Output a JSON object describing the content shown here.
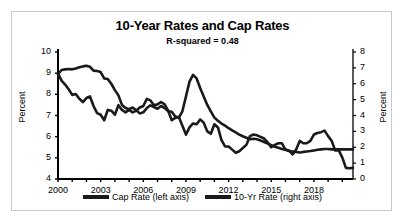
{
  "chart_data": {
    "type": "line",
    "title": "10-Year Rates and Cap Rates",
    "subtitle": "R-squared = 0.48",
    "xlabel": "",
    "ylabel": "Percent",
    "ylabel_right": "Percent",
    "xlim": [
      2000,
      2020.75
    ],
    "ylim": [
      4,
      10
    ],
    "ylim_right": [
      0,
      8
    ],
    "grid": false,
    "legend_position": "bottom",
    "x_ticks": [
      "2000",
      "2003",
      "2006",
      "2009",
      "2012",
      "2015",
      "2018"
    ],
    "x_tick_values": [
      2000,
      2003,
      2006,
      2009,
      2012,
      2015,
      2018
    ],
    "y_ticks_left": [
      "4",
      "5",
      "6",
      "7",
      "8",
      "9",
      "10"
    ],
    "y_tick_values_left": [
      4,
      5,
      6,
      7,
      8,
      9,
      10
    ],
    "y_ticks_right": [
      "0",
      "1",
      "2",
      "3",
      "4",
      "5",
      "6",
      "7",
      "8"
    ],
    "y_tick_values_right": [
      0,
      1,
      2,
      3,
      4,
      5,
      6,
      7,
      8
    ],
    "series": [
      {
        "name": "Cap Rate (left axis)",
        "axis": "left",
        "color": "#1a1a1a",
        "x": [
          2000.0,
          2000.25,
          2000.5,
          2000.75,
          2001.0,
          2001.25,
          2001.5,
          2001.75,
          2002.0,
          2002.25,
          2002.5,
          2002.75,
          2003.0,
          2003.25,
          2003.5,
          2003.75,
          2004.0,
          2004.25,
          2004.5,
          2004.75,
          2005.0,
          2005.25,
          2005.5,
          2005.75,
          2006.0,
          2006.25,
          2006.5,
          2006.75,
          2007.0,
          2007.25,
          2007.5,
          2007.75,
          2008.0,
          2008.25,
          2008.5,
          2008.75,
          2009.0,
          2009.25,
          2009.5,
          2009.75,
          2010.0,
          2010.25,
          2010.5,
          2010.75,
          2011.0,
          2011.25,
          2011.5,
          2011.75,
          2012.0,
          2012.25,
          2012.5,
          2012.75,
          2013.0,
          2013.25,
          2013.5,
          2013.75,
          2014.0,
          2014.25,
          2014.5,
          2014.75,
          2015.0,
          2015.25,
          2015.5,
          2015.75,
          2016.0,
          2016.25,
          2016.5,
          2016.75,
          2017.0,
          2017.25,
          2017.5,
          2017.75,
          2018.0,
          2018.25,
          2018.5,
          2018.75,
          2019.0,
          2019.25,
          2019.5,
          2019.75,
          2020.0,
          2020.25,
          2020.5,
          2020.75
        ],
        "values": [
          8.95,
          9.15,
          9.18,
          9.2,
          9.18,
          9.22,
          9.28,
          9.32,
          9.35,
          9.3,
          9.12,
          9.1,
          9.05,
          8.75,
          8.72,
          8.5,
          8.2,
          7.95,
          7.5,
          7.35,
          7.3,
          7.38,
          7.25,
          7.1,
          7.15,
          7.35,
          7.48,
          7.4,
          7.32,
          7.45,
          7.35,
          7.2,
          7.18,
          6.95,
          6.9,
          7.2,
          7.9,
          8.6,
          8.92,
          8.75,
          8.3,
          7.9,
          7.5,
          7.2,
          6.9,
          6.75,
          6.62,
          6.52,
          6.4,
          6.3,
          6.2,
          6.1,
          6.02,
          5.95,
          5.88,
          5.9,
          5.88,
          5.82,
          5.75,
          5.68,
          5.6,
          5.52,
          5.48,
          5.42,
          5.38,
          5.32,
          5.3,
          5.28,
          5.25,
          5.28,
          5.3,
          5.32,
          5.35,
          5.38,
          5.4,
          5.42,
          5.42,
          5.4,
          5.4,
          5.4,
          5.4,
          5.4,
          5.4,
          5.4
        ]
      },
      {
        "name": "10-Yr Rate (right axis)",
        "axis": "right",
        "color": "#1a1a1a",
        "x": [
          2000.0,
          2000.25,
          2000.5,
          2000.75,
          2001.0,
          2001.25,
          2001.5,
          2001.75,
          2002.0,
          2002.25,
          2002.5,
          2002.75,
          2003.0,
          2003.25,
          2003.5,
          2003.75,
          2004.0,
          2004.25,
          2004.5,
          2004.75,
          2005.0,
          2005.25,
          2005.5,
          2005.75,
          2006.0,
          2006.25,
          2006.5,
          2006.75,
          2007.0,
          2007.25,
          2007.5,
          2007.75,
          2008.0,
          2008.25,
          2008.5,
          2008.75,
          2009.0,
          2009.25,
          2009.5,
          2009.75,
          2010.0,
          2010.25,
          2010.5,
          2010.75,
          2011.0,
          2011.25,
          2011.5,
          2011.75,
          2012.0,
          2012.25,
          2012.5,
          2012.75,
          2013.0,
          2013.25,
          2013.5,
          2013.75,
          2014.0,
          2014.25,
          2014.5,
          2014.75,
          2015.0,
          2015.25,
          2015.5,
          2015.75,
          2016.0,
          2016.25,
          2016.5,
          2016.75,
          2017.0,
          2017.25,
          2017.5,
          2017.75,
          2018.0,
          2018.25,
          2018.5,
          2018.75,
          2019.0,
          2019.25,
          2019.5,
          2019.75,
          2020.0,
          2020.25,
          2020.5,
          2020.75
        ],
        "values": [
          6.65,
          6.2,
          5.95,
          5.65,
          5.3,
          5.35,
          5.05,
          4.85,
          5.1,
          5.2,
          4.6,
          4.15,
          4.05,
          3.7,
          4.35,
          4.3,
          4.05,
          4.65,
          4.35,
          4.2,
          4.35,
          4.2,
          4.3,
          4.5,
          4.6,
          5.05,
          4.95,
          4.65,
          4.7,
          4.85,
          4.7,
          4.3,
          3.7,
          3.85,
          3.9,
          3.35,
          2.8,
          3.25,
          3.5,
          3.45,
          3.75,
          3.55,
          3.0,
          2.85,
          3.45,
          3.25,
          2.45,
          2.05,
          2.05,
          1.85,
          1.65,
          1.75,
          1.95,
          2.15,
          2.7,
          2.8,
          2.75,
          2.65,
          2.55,
          2.3,
          2.0,
          2.15,
          2.25,
          2.25,
          1.85,
          1.8,
          1.55,
          1.85,
          2.4,
          2.25,
          2.25,
          2.4,
          2.8,
          2.9,
          2.95,
          3.05,
          2.7,
          2.4,
          1.8,
          1.8,
          1.35,
          0.7,
          0.68,
          0.7
        ]
      }
    ]
  },
  "legend": {
    "entries": [
      {
        "label": "Cap Rate (left axis)"
      },
      {
        "label": "10-Yr Rate (right axis)"
      }
    ]
  }
}
